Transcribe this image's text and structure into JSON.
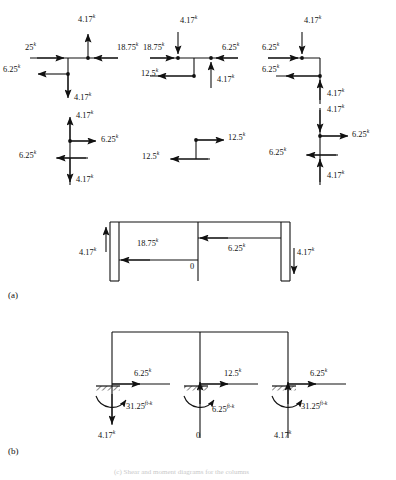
{
  "figure": {
    "units_kip": "k",
    "units_moment": "ft-k",
    "sections": [
      {
        "key": "a",
        "label": "(a)"
      },
      {
        "key": "b",
        "label": "(b)"
      }
    ],
    "bottom_caption": "(c) Shear and moment diagrams for the columns"
  },
  "joint_diagrams": [
    {
      "name": "left-joint-upper",
      "forces": [
        {
          "id": "ljU-up",
          "value": "4.17",
          "unit": "k"
        },
        {
          "id": "ljU-left",
          "value": "25",
          "unit": "k"
        },
        {
          "id": "ljU-right",
          "value": "18.75",
          "unit": "k"
        },
        {
          "id": "ljU-web",
          "value": "6.25",
          "unit": "k"
        },
        {
          "id": "ljU-down",
          "value": "4.17",
          "unit": "k"
        }
      ]
    },
    {
      "name": "left-joint-lower",
      "forces": [
        {
          "id": "ljL-up",
          "value": "4.17",
          "unit": "k"
        },
        {
          "id": "ljL-right",
          "value": "6.25",
          "unit": "k"
        },
        {
          "id": "ljL-left",
          "value": "6.25",
          "unit": "k"
        },
        {
          "id": "ljL-down",
          "value": "4.17",
          "unit": "k"
        }
      ]
    },
    {
      "name": "mid-joint-upper",
      "forces": [
        {
          "id": "mjU-down",
          "value": "4.17",
          "unit": "k"
        },
        {
          "id": "mjU-left",
          "value": "18.75",
          "unit": "k"
        },
        {
          "id": "mjU-right",
          "value": "6.25",
          "unit": "k"
        },
        {
          "id": "mjU-web",
          "value": "12.5",
          "unit": "k"
        },
        {
          "id": "mjU-up",
          "value": "4.17",
          "unit": "k"
        }
      ]
    },
    {
      "name": "mid-joint-lower",
      "forces": [
        {
          "id": "mjL-right",
          "value": "12.5",
          "unit": "k"
        },
        {
          "id": "mjL-left",
          "value": "12.5",
          "unit": "k"
        }
      ]
    },
    {
      "name": "right-joint-upper",
      "forces": [
        {
          "id": "rjU-down",
          "value": "4.17",
          "unit": "k"
        },
        {
          "id": "rjU-left",
          "value": "6.25",
          "unit": "k"
        },
        {
          "id": "rjU-web",
          "value": "6.25",
          "unit": "k"
        },
        {
          "id": "rjU-colup",
          "value": "4.17",
          "unit": "k"
        }
      ]
    },
    {
      "name": "right-joint-lower",
      "forces": [
        {
          "id": "rjL-down",
          "value": "4.17",
          "unit": "k"
        },
        {
          "id": "rjL-right",
          "value": "6.25",
          "unit": "k"
        },
        {
          "id": "rjL-left",
          "value": "6.25",
          "unit": "k"
        },
        {
          "id": "rjL-up",
          "value": "4.17",
          "unit": "k"
        }
      ]
    }
  ],
  "frame_a": {
    "name": "girder-free-body",
    "forces": [
      {
        "id": "fa-left-col",
        "value": "4.17",
        "unit": "k"
      },
      {
        "id": "fa-left-bm",
        "value": "18.75",
        "unit": "k"
      },
      {
        "id": "fa-right-bm",
        "value": "6.25",
        "unit": "k"
      },
      {
        "id": "fa-right-col",
        "value": "4.17",
        "unit": "k"
      },
      {
        "id": "fa-zero",
        "value": "0",
        "unit": ""
      }
    ]
  },
  "frame_b": {
    "name": "column-base-reactions",
    "supports": [
      {
        "id": "sup-left",
        "shear": "6.25",
        "shear_unit": "k",
        "moment": "31.25",
        "moment_unit": "ft-k",
        "axial": "4.17",
        "axial_unit": "k"
      },
      {
        "id": "sup-mid",
        "shear": "12.5",
        "shear_unit": "k",
        "moment": "6.25",
        "moment_unit": "ft-k",
        "axial": "0",
        "axial_unit": ""
      },
      {
        "id": "sup-right",
        "shear": "6.25",
        "shear_unit": "k",
        "moment": "31.25",
        "moment_unit": "ft-k",
        "axial": "4.17",
        "axial_unit": "k"
      }
    ]
  }
}
